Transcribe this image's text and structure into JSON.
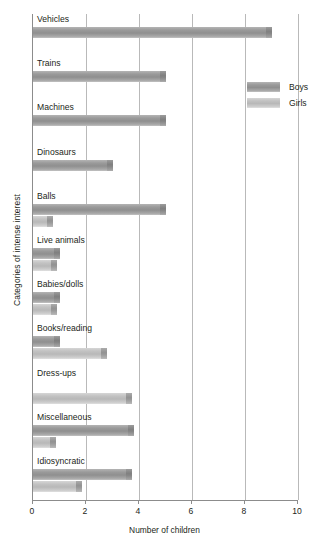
{
  "chart_data": {
    "type": "bar",
    "orientation": "horizontal",
    "title": "",
    "xlabel": "Number of children",
    "ylabel": "Categories of intense interest",
    "xlim": [
      0,
      10
    ],
    "xticks": [
      0,
      2,
      4,
      6,
      8,
      10
    ],
    "grid": true,
    "legend_position": "top-right",
    "categories": [
      "Vehicles",
      "Trains",
      "Machines",
      "Dinosaurs",
      "Balls",
      "Live animals",
      "Babies/dolls",
      "Books/reading",
      "Dress-ups",
      "Miscellaneous",
      "Idiosyncratic"
    ],
    "series": [
      {
        "name": "Boys",
        "color": "#949494",
        "values": [
          9,
          5,
          5,
          3,
          5,
          1,
          1,
          1,
          0,
          3.8,
          3.75
        ]
      },
      {
        "name": "Girls",
        "color": "#c4c4c4",
        "values": [
          0,
          0,
          0,
          0,
          0.75,
          0.9,
          0.9,
          2.8,
          3.75,
          0.85,
          1.85
        ]
      }
    ]
  },
  "legend": {
    "items": [
      {
        "label": "Boys"
      },
      {
        "label": "Girls"
      }
    ]
  },
  "axis": {
    "x_tick_labels": [
      "0",
      "2",
      "4",
      "6",
      "8",
      "10"
    ],
    "x_title": "Number of children",
    "y_title": "Categories of intense interest"
  }
}
